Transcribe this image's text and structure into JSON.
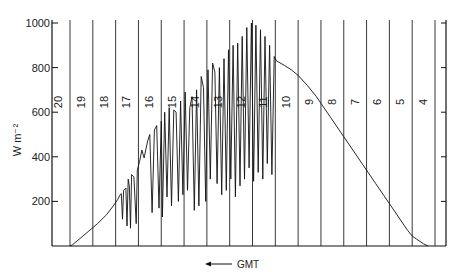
{
  "chart_data": {
    "type": "line",
    "title": "",
    "ylabel": "W m⁻²",
    "xlabel": "GMT",
    "xlabel_arrow": "left",
    "ylim": [
      0,
      1000
    ],
    "yticks": [
      200,
      400,
      600,
      800,
      1000
    ],
    "ytick_labels": [
      "200",
      "400",
      "600",
      "800",
      "1000"
    ],
    "x_direction": "decreasing",
    "xlim": [
      20.1,
      3.6
    ],
    "hour_lines": [
      20,
      19,
      18,
      17,
      16,
      15,
      14,
      13,
      12,
      11,
      10,
      9,
      8,
      7,
      6,
      5,
      4
    ],
    "hour_labels": [
      "20",
      "19",
      "18",
      "17",
      "16",
      "15",
      "14",
      "13",
      "12",
      "11",
      "10",
      "9",
      "8",
      "7",
      "6",
      "5",
      "4"
    ],
    "grid": "vertical hour lines",
    "right_axis_ticks": true,
    "series": [
      {
        "name": "Global irradiance",
        "x_unit": "GMT hour",
        "points": [
          [
            20.0,
            0
          ],
          [
            19.9,
            5
          ],
          [
            19.6,
            30
          ],
          [
            19.2,
            65
          ],
          [
            18.8,
            100
          ],
          [
            18.4,
            140
          ],
          [
            18.1,
            180
          ],
          [
            17.9,
            210
          ],
          [
            17.8,
            230
          ],
          [
            17.75,
            235
          ],
          [
            17.7,
            120
          ],
          [
            17.65,
            250
          ],
          [
            17.55,
            260
          ],
          [
            17.5,
            90
          ],
          [
            17.45,
            300
          ],
          [
            17.4,
            270
          ],
          [
            17.35,
            80
          ],
          [
            17.3,
            320
          ],
          [
            17.2,
            310
          ],
          [
            17.1,
            100
          ],
          [
            17.05,
            340
          ],
          [
            16.95,
            380
          ],
          [
            16.85,
            430
          ],
          [
            16.75,
            395
          ],
          [
            16.6,
            470
          ],
          [
            16.5,
            500
          ],
          [
            16.4,
            150
          ],
          [
            16.3,
            520
          ],
          [
            16.2,
            540
          ],
          [
            16.1,
            170
          ],
          [
            16.0,
            560
          ],
          [
            15.95,
            130
          ],
          [
            15.85,
            600
          ],
          [
            15.75,
            220
          ],
          [
            15.65,
            620
          ],
          [
            15.55,
            180
          ],
          [
            15.45,
            610
          ],
          [
            15.35,
            600
          ],
          [
            15.25,
            200
          ],
          [
            15.15,
            650
          ],
          [
            15.05,
            230
          ],
          [
            14.95,
            690
          ],
          [
            14.85,
            250
          ],
          [
            14.75,
            620
          ],
          [
            14.65,
            670
          ],
          [
            14.55,
            160
          ],
          [
            14.45,
            700
          ],
          [
            14.35,
            180
          ],
          [
            14.25,
            760
          ],
          [
            14.15,
            710
          ],
          [
            14.05,
            200
          ],
          [
            13.95,
            790
          ],
          [
            13.85,
            300
          ],
          [
            13.75,
            820
          ],
          [
            13.65,
            780
          ],
          [
            13.55,
            280
          ],
          [
            13.45,
            800
          ],
          [
            13.35,
            230
          ],
          [
            13.25,
            840
          ],
          [
            13.15,
            250
          ],
          [
            13.05,
            880
          ],
          [
            12.95,
            300
          ],
          [
            12.85,
            900
          ],
          [
            12.75,
            220
          ],
          [
            12.65,
            910
          ],
          [
            12.55,
            270
          ],
          [
            12.45,
            940
          ],
          [
            12.35,
            300
          ],
          [
            12.25,
            980
          ],
          [
            12.15,
            350
          ],
          [
            12.05,
            1000
          ],
          [
            11.95,
            290
          ],
          [
            11.85,
            990
          ],
          [
            11.75,
            330
          ],
          [
            11.65,
            970
          ],
          [
            11.55,
            300
          ],
          [
            11.45,
            940
          ],
          [
            11.35,
            370
          ],
          [
            11.25,
            900
          ],
          [
            11.15,
            320
          ],
          [
            11.05,
            850
          ],
          [
            10.95,
            830
          ],
          [
            10.6,
            810
          ],
          [
            10.3,
            790
          ],
          [
            10.0,
            765
          ],
          [
            9.6,
            720
          ],
          [
            9.2,
            670
          ],
          [
            9.0,
            640
          ],
          [
            8.6,
            580
          ],
          [
            8.2,
            520
          ],
          [
            8.0,
            490
          ],
          [
            7.6,
            430
          ],
          [
            7.2,
            370
          ],
          [
            7.0,
            340
          ],
          [
            6.6,
            280
          ],
          [
            6.2,
            220
          ],
          [
            6.0,
            190
          ],
          [
            5.6,
            130
          ],
          [
            5.2,
            70
          ],
          [
            5.0,
            45
          ],
          [
            4.8,
            30
          ],
          [
            4.5,
            10
          ],
          [
            4.3,
            0
          ]
        ]
      }
    ]
  }
}
